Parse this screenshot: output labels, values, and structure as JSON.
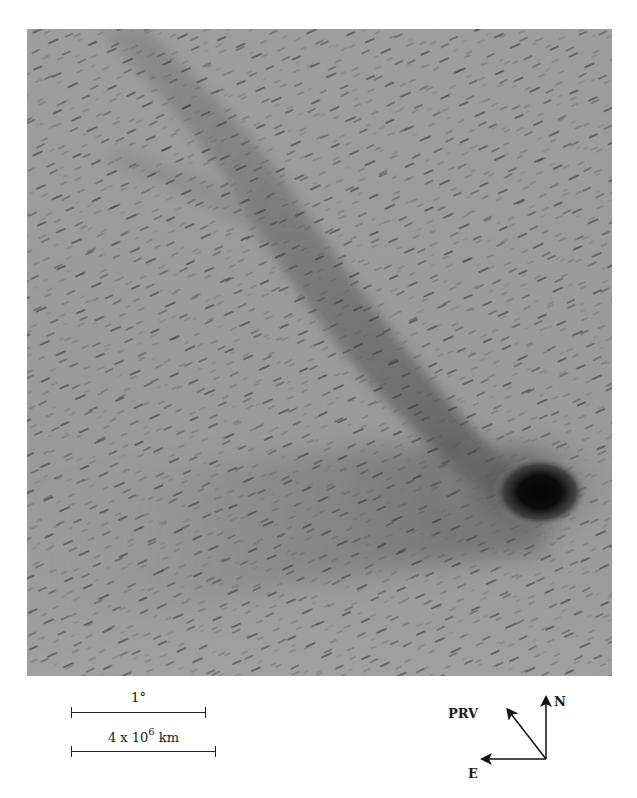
{
  "figure": {
    "colors": {
      "sky_background": "#9c9c9c",
      "nucleus": "#0a0a0a",
      "ink": "#1a1a1a"
    }
  },
  "scale_bars": {
    "angular": {
      "label": "1°"
    },
    "linear": {
      "label_mantissa": "4 x 10",
      "label_exponent": "6",
      "label_unit": "km"
    }
  },
  "compass": {
    "north_label": "N",
    "east_label": "E",
    "prv_label": "PRV"
  }
}
